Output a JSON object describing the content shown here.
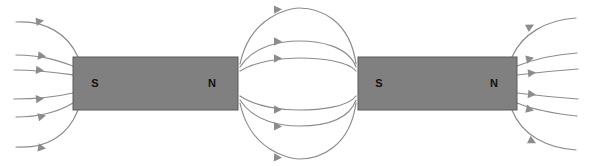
{
  "figure": {
    "width": 592,
    "height": 166,
    "background_color": "#ffffff"
  },
  "style": {
    "magnet_fill": "#808080",
    "magnet_stroke": "#5a5a5a",
    "field_line_color": "#8c8c8c",
    "arrow_color": "#8c8c8c",
    "label_color": "#111111",
    "field_line_width": 1.2
  },
  "magnets": [
    {
      "id": "magnet-left",
      "x": 73,
      "y": 57,
      "width": 165,
      "height": 53,
      "south_label": "S",
      "north_label": "N",
      "south_label_x": 95,
      "north_label_x": 212,
      "label_y": 84
    },
    {
      "id": "magnet-right",
      "x": 358,
      "y": 57,
      "width": 159,
      "height": 53,
      "south_label": "S",
      "north_label": "N",
      "south_label_x": 379,
      "north_label_x": 494,
      "label_y": 84
    }
  ],
  "field_regions": [
    {
      "id": "left-outer",
      "description": "Six field lines entering the south pole of the left magnet from the left edge",
      "direction": "rightward-into-south-pole",
      "line_count": 6,
      "lines": [
        {
          "path": "M 16,22 C 45,20 68,34 78,57",
          "arrow_x": 44,
          "arrow_y": 20.6,
          "arrow_angle": -9
        },
        {
          "path": "M 16,55 C 45,55 62,62 73,66",
          "arrow_x": 46,
          "arrow_y": 56.6,
          "arrow_angle": 8
        },
        {
          "path": "M 14,70 C 42,70 60,73 73,75",
          "arrow_x": 44,
          "arrow_y": 70.6,
          "arrow_angle": 5
        },
        {
          "path": "M 14,99 C 42,99 60,96 73,93",
          "arrow_x": 44,
          "arrow_y": 98.4,
          "arrow_angle": -5
        },
        {
          "path": "M 16,117 C 45,117 63,109 73,103",
          "arrow_x": 46,
          "arrow_y": 115.6,
          "arrow_angle": -12
        },
        {
          "path": "M 16,147 C 46,149 68,136 78,110",
          "arrow_x": 46,
          "arrow_y": 148.6,
          "arrow_angle": 9
        }
      ]
    },
    {
      "id": "center-between",
      "description": "Six field lines arcing from the north pole of the left magnet to the south pole of the right magnet",
      "direction": "rightward",
      "line_count": 6,
      "lines": [
        {
          "path": "M 240,64 C 250,16 290,8 299,8 C 320,8 350,20 356,64",
          "arrow_x": 282,
          "arrow_y": 9.2,
          "arrow_angle": -3
        },
        {
          "path": "M 240,67 C 254,45 282,41 299,41 C 320,41 348,46 356,67",
          "arrow_x": 282,
          "arrow_y": 41.4,
          "arrow_angle": -1
        },
        {
          "path": "M 240,71 C 256,61 282,58 299,58 C 320,58 348,61 356,71",
          "arrow_x": 282,
          "arrow_y": 58.3,
          "arrow_angle": -1
        },
        {
          "path": "M 240,96 C 256,107 282,110 299,110 C 320,110 348,107 356,96",
          "arrow_x": 282,
          "arrow_y": 109.7,
          "arrow_angle": 1
        },
        {
          "path": "M 240,100 C 254,122 282,126 299,126 C 320,126 348,122 356,100",
          "arrow_x": 282,
          "arrow_y": 126.4,
          "arrow_angle": 1
        },
        {
          "path": "M 240,103 C 250,151 290,159 299,159 C 320,159 350,147 356,103",
          "arrow_x": 282,
          "arrow_y": 157.8,
          "arrow_angle": 3
        }
      ]
    },
    {
      "id": "right-outer",
      "description": "Six field lines leaving the north pole of the right magnet toward the right edge",
      "direction": "rightward-out-of-north-pole",
      "line_count": 6,
      "lines": [
        {
          "path": "M 512,57 C 522,34 546,20 576,18",
          "arrow_x": 534,
          "arrow_y": 24.6,
          "arrow_angle": -28
        },
        {
          "path": "M 517,66 C 532,60 548,55 577,53",
          "arrow_x": 534,
          "arrow_y": 57.8,
          "arrow_angle": -13
        },
        {
          "path": "M 517,75 C 534,73 552,71 578,69",
          "arrow_x": 536,
          "arrow_y": 72.6,
          "arrow_angle": -6
        },
        {
          "path": "M 517,93 C 534,95 552,97 578,99",
          "arrow_x": 536,
          "arrow_y": 94.8,
          "arrow_angle": 6
        },
        {
          "path": "M 517,103 C 532,109 548,113 577,116",
          "arrow_x": 534,
          "arrow_y": 110.5,
          "arrow_angle": 13
        },
        {
          "path": "M 512,110 C 522,136 548,148 576,150",
          "arrow_x": 536,
          "arrow_y": 143.2,
          "arrow_angle": 27
        }
      ]
    }
  ]
}
